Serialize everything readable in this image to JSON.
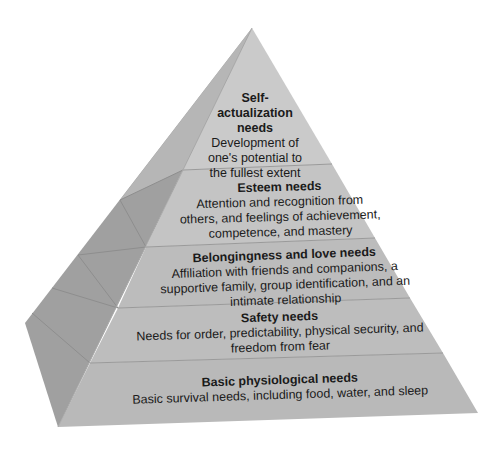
{
  "diagram": {
    "type": "pyramid",
    "colors": {
      "front_top": "#c9c9c9",
      "front_bottom": "#b9b9b9",
      "side": "#9e9e9e",
      "side_light": "#b4b4b4",
      "edge": "#8f8f8f",
      "background": "#ffffff"
    },
    "levels": [
      {
        "title": "Self-actualization needs",
        "title_lines": [
          "Self-",
          "actualization",
          "needs"
        ],
        "description_lines": [
          "Development of",
          "one's potential to",
          "the fullest extent"
        ]
      },
      {
        "title": "Esteem needs",
        "description_lines": [
          "Attention and recognition from",
          "others, and feelings of achievement,",
          "competence, and mastery"
        ]
      },
      {
        "title": "Belongingness and love needs",
        "description_lines": [
          "Affiliation with friends and companions, a",
          "supportive family, group identification, and an",
          "intimate relationship"
        ]
      },
      {
        "title": "Safety needs",
        "description_lines": [
          "Needs for order, predictability, physical security, and",
          "freedom from fear"
        ]
      },
      {
        "title": "Basic physiological needs",
        "description_lines": [
          "Basic survival needs, including food, water, and sleep"
        ]
      }
    ]
  }
}
